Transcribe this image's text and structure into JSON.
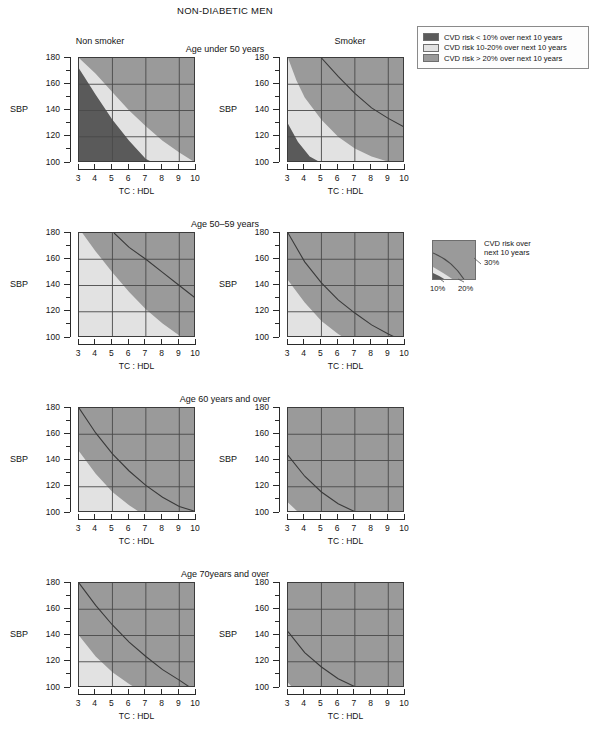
{
  "title": "NON-DIABETIC MEN",
  "columns": [
    {
      "label": "Non smoker",
      "key": "nonsmoker"
    },
    {
      "label": "Smoker",
      "key": "smoker"
    }
  ],
  "rows": [
    {
      "label": "Age under 50 years"
    },
    {
      "label": "Age 50–59 years"
    },
    {
      "label": "Age 60 years and over"
    },
    {
      "label": "Age 70years and over"
    }
  ],
  "axes": {
    "y_label": "SBP",
    "x_label": "TC : HDL",
    "y_ticks": [
      "180",
      "160",
      "140",
      "120",
      "100"
    ],
    "y_values": [
      180,
      160,
      140,
      120,
      100
    ],
    "y_minor_values": [
      170,
      150,
      130,
      110
    ],
    "y_range": [
      100,
      180
    ],
    "x_ticks": [
      "3",
      "4",
      "5",
      "6",
      "7",
      "8",
      "9",
      "10"
    ],
    "x_values": [
      3,
      4,
      5,
      6,
      7,
      8,
      9,
      10
    ],
    "x_range": [
      3,
      10
    ],
    "gridlines_x": [
      5,
      7,
      9
    ],
    "gridlines_y": [
      120,
      140,
      160
    ]
  },
  "legend": {
    "items": [
      {
        "swatch": "#5a5a5a",
        "text": "CVD risk < 10% over next 10 years"
      },
      {
        "swatch": "#e2e2e2",
        "text": "CVD risk 10-20% over next 10 years"
      },
      {
        "swatch": "#9a9a9a",
        "text": "CVD risk > 20% over next 10 years"
      }
    ]
  },
  "contour_legend": {
    "caption_line1": "CVD risk over",
    "caption_line2": "next 10 years",
    "label_30": "30%",
    "label_10": "10%",
    "label_20": "20%"
  },
  "colors": {
    "risk_under_10": "#5a5a5a",
    "risk_10_20": "#e2e2e2",
    "risk_over_20": "#9a9a9a",
    "axis": "#2a2a2a",
    "gridline": "#4a4a4a",
    "contour": "#3a3a3a",
    "background": "#ffffff"
  },
  "chart_data": {
    "type": "heatmap",
    "title": "NON-DIABETIC MEN",
    "xlabel": "TC : HDL",
    "ylabel": "SBP",
    "xlim": [
      3,
      10
    ],
    "ylim": [
      100,
      180
    ],
    "grid": true,
    "legend_position": "top-right",
    "bands": [
      {
        "name": "CVD risk < 10% over next 10 years",
        "color": "#5a5a5a"
      },
      {
        "name": "CVD risk 10-20% over next 10 years",
        "color": "#e2e2e2"
      },
      {
        "name": "CVD risk > 20% over next 10 years",
        "color": "#9a9a9a"
      }
    ],
    "panels": [
      {
        "row": "Age under 50 years",
        "column": "Non smoker",
        "boundary_10pct": [
          [
            3,
            172
          ],
          [
            4,
            152
          ],
          [
            5,
            133
          ],
          [
            6,
            117
          ],
          [
            7,
            103
          ],
          [
            7.5,
            100
          ]
        ],
        "boundary_20pct": [
          [
            3,
            180
          ],
          [
            4,
            168
          ],
          [
            5,
            154
          ],
          [
            6,
            140
          ],
          [
            7,
            128
          ],
          [
            8,
            117
          ],
          [
            9,
            108
          ],
          [
            10,
            100
          ]
        ],
        "contour_30pct": null
      },
      {
        "row": "Age under 50 years",
        "column": "Smoker",
        "boundary_10pct": [
          [
            3,
            130
          ],
          [
            3.6,
            116
          ],
          [
            4.3,
            105
          ],
          [
            5,
            100
          ]
        ],
        "boundary_20pct": [
          [
            3,
            180
          ],
          [
            3.5,
            163
          ],
          [
            4,
            150
          ],
          [
            5,
            133
          ],
          [
            6,
            120
          ],
          [
            7,
            111
          ],
          [
            8,
            105
          ],
          [
            9,
            101
          ],
          [
            9.2,
            100
          ]
        ],
        "contour_30pct": [
          [
            5,
            180
          ],
          [
            6,
            166
          ],
          [
            7,
            153
          ],
          [
            8,
            142
          ],
          [
            9,
            134
          ],
          [
            10,
            127
          ]
        ]
      },
      {
        "row": "Age 50–59 years",
        "column": "Non smoker",
        "boundary_10pct": null,
        "boundary_20pct": [
          [
            3.2,
            180
          ],
          [
            4,
            166
          ],
          [
            5,
            150
          ],
          [
            6,
            135
          ],
          [
            7,
            122
          ],
          [
            8,
            111
          ],
          [
            9,
            102
          ],
          [
            9.3,
            100
          ]
        ],
        "contour_30pct": [
          [
            5.1,
            180
          ],
          [
            6,
            169
          ],
          [
            7,
            160
          ],
          [
            8,
            150
          ],
          [
            9,
            140
          ],
          [
            10,
            130
          ]
        ]
      },
      {
        "row": "Age 50–59 years",
        "column": "Smoker",
        "boundary_10pct": null,
        "boundary_20pct": [
          [
            3,
            144
          ],
          [
            4,
            127
          ],
          [
            5,
            113
          ],
          [
            6,
            103
          ],
          [
            6.4,
            100
          ]
        ],
        "contour_30pct": [
          [
            3,
            180
          ],
          [
            4,
            158
          ],
          [
            5,
            142
          ],
          [
            6,
            129
          ],
          [
            7,
            119
          ],
          [
            8,
            110
          ],
          [
            9,
            103
          ],
          [
            9.5,
            100
          ]
        ]
      },
      {
        "row": "Age 60 years and over",
        "column": "Non smoker",
        "boundary_10pct": null,
        "boundary_20pct": [
          [
            3,
            147
          ],
          [
            4,
            130
          ],
          [
            5,
            116
          ],
          [
            6,
            106
          ],
          [
            6.7,
            100
          ]
        ],
        "contour_30pct": [
          [
            3,
            180
          ],
          [
            4,
            161
          ],
          [
            5,
            145
          ],
          [
            6,
            132
          ],
          [
            7,
            121
          ],
          [
            8,
            112
          ],
          [
            9,
            105
          ],
          [
            10,
            101
          ]
        ]
      },
      {
        "row": "Age 60 years and over",
        "column": "Smoker",
        "boundary_10pct": null,
        "boundary_20pct": [
          [
            3,
            108
          ],
          [
            3.5,
            102
          ],
          [
            3.8,
            100
          ]
        ],
        "contour_30pct": [
          [
            3,
            144
          ],
          [
            4,
            128
          ],
          [
            5,
            116
          ],
          [
            6,
            107
          ],
          [
            7,
            101
          ],
          [
            7.2,
            100
          ]
        ]
      },
      {
        "row": "Age 70years and over",
        "column": "Non smoker",
        "boundary_10pct": null,
        "boundary_20pct": [
          [
            3,
            140
          ],
          [
            4,
            124
          ],
          [
            5,
            112
          ],
          [
            6,
            103
          ],
          [
            6.4,
            100
          ]
        ],
        "contour_30pct": [
          [
            3,
            180
          ],
          [
            4,
            163
          ],
          [
            5,
            148
          ],
          [
            6,
            135
          ],
          [
            7,
            124
          ],
          [
            8,
            114
          ],
          [
            9,
            106
          ],
          [
            9.7,
            100
          ]
        ]
      },
      {
        "row": "Age 70years and over",
        "column": "Smoker",
        "boundary_10pct": null,
        "boundary_20pct": [
          [
            3,
            104
          ],
          [
            3.3,
            100
          ]
        ],
        "contour_30pct": [
          [
            3,
            143
          ],
          [
            4,
            127
          ],
          [
            5,
            116
          ],
          [
            6,
            107
          ],
          [
            7,
            101
          ],
          [
            7.3,
            100
          ]
        ]
      }
    ]
  },
  "layout": {
    "panel_left_x": 78,
    "panel_right_x": 287,
    "panel_width": 117,
    "panel_height": 105,
    "row_tops": [
      57,
      232,
      407,
      582
    ]
  }
}
